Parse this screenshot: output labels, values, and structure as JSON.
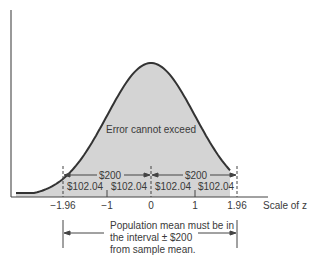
{
  "chart_data": {
    "type": "area",
    "title": "",
    "xlabel": "Scale of z",
    "ylabel": "",
    "x_ticks": [
      "−1.96",
      "−1",
      "0",
      "1",
      "1.96"
    ],
    "x_tick_values": [
      -1.96,
      -1,
      0,
      1,
      1.96
    ],
    "curve": "standard normal density",
    "shaded_region": [
      -1.96,
      1.96
    ],
    "inner_label": "Error cannot exceed",
    "brackets": [
      {
        "from": -1.96,
        "to": 0,
        "label": "$200"
      },
      {
        "from": 0,
        "to": 1.96,
        "label": "$200"
      }
    ],
    "segments": [
      {
        "from": -1.96,
        "to": -1,
        "label": "$102.04"
      },
      {
        "from": -1,
        "to": 0,
        "label": "$102.04"
      },
      {
        "from": 0,
        "to": 1,
        "label": "$102.04"
      },
      {
        "from": 1,
        "to": 1.96,
        "label": "$102.04"
      }
    ],
    "annotation": [
      "Population mean must be in",
      "the interval ± $200",
      "from sample mean."
    ]
  },
  "colors": {
    "fill": "#d4d4d4",
    "stroke": "#333333"
  }
}
